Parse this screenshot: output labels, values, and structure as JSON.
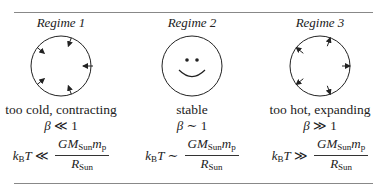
{
  "regimes": [
    {
      "title": "Regime 1",
      "figure": "circle-inward-arrows",
      "description": "too cold, contracting",
      "beta_relation": "≪",
      "beta_rhs": "1",
      "eq_relation": "≪"
    },
    {
      "title": "Regime 2",
      "figure": "smiley-face",
      "description": "stable",
      "beta_relation": "∼",
      "beta_rhs": "1",
      "eq_relation": "∼"
    },
    {
      "title": "Regime 3",
      "figure": "circle-outward-arrows",
      "description": "too hot, expanding",
      "beta_relation": "≫",
      "beta_rhs": "1",
      "eq_relation": "≫"
    }
  ],
  "symbols": {
    "beta": "β",
    "k": "k",
    "k_sub": "B",
    "T": "T",
    "G": "G",
    "M": "M",
    "sun_sub": "Sun",
    "m": "m",
    "p_sub": "p",
    "R": "R"
  }
}
